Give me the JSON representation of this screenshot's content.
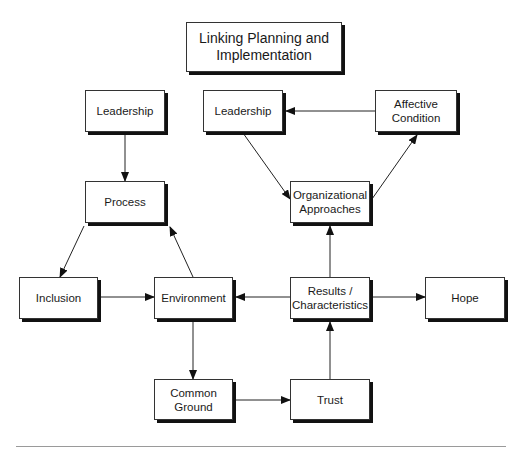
{
  "diagram": {
    "title": "Linking Planning and\nImplementation",
    "nodes": [
      {
        "id": "leadership-left",
        "label": "Leadership",
        "x": 85,
        "y": 90,
        "w": 80,
        "h": 42
      },
      {
        "id": "process",
        "label": "Process",
        "x": 85,
        "y": 181,
        "w": 80,
        "h": 42
      },
      {
        "id": "leadership-right",
        "label": "Leadership",
        "x": 203,
        "y": 90,
        "w": 80,
        "h": 42
      },
      {
        "id": "affective-condition",
        "label": "Affective\nCondition",
        "x": 375,
        "y": 90,
        "w": 82,
        "h": 42
      },
      {
        "id": "organizational-approaches",
        "label": "Organizational\nApproaches",
        "x": 290,
        "y": 181,
        "w": 80,
        "h": 42
      },
      {
        "id": "inclusion",
        "label": "Inclusion",
        "x": 19,
        "y": 277,
        "w": 79,
        "h": 42
      },
      {
        "id": "environment",
        "label": "Environment",
        "x": 154,
        "y": 277,
        "w": 79,
        "h": 42
      },
      {
        "id": "results-characteristics",
        "label": "Results /\nCharacteristics",
        "x": 290,
        "y": 277,
        "w": 80,
        "h": 42
      },
      {
        "id": "hope",
        "label": "Hope",
        "x": 425,
        "y": 277,
        "w": 80,
        "h": 42
      },
      {
        "id": "common-ground",
        "label": "Common\nGround",
        "x": 154,
        "y": 379,
        "w": 79,
        "h": 41
      },
      {
        "id": "trust",
        "label": "Trust",
        "x": 290,
        "y": 379,
        "w": 80,
        "h": 41
      }
    ],
    "edges": [
      {
        "from": "Leadership (left)",
        "to": "Process"
      },
      {
        "from": "Process",
        "to": "Inclusion"
      },
      {
        "from": "Inclusion",
        "to": "Environment"
      },
      {
        "from": "Environment",
        "to": "Process"
      },
      {
        "from": "Environment",
        "to": "Common Ground"
      },
      {
        "from": "Common Ground",
        "to": "Trust"
      },
      {
        "from": "Trust",
        "to": "Results / Characteristics"
      },
      {
        "from": "Results / Characteristics",
        "to": "Environment"
      },
      {
        "from": "Results / Characteristics",
        "to": "Hope"
      },
      {
        "from": "Results / Characteristics",
        "to": "Organizational Approaches"
      },
      {
        "from": "Organizational Approaches",
        "to": "Affective Condition"
      },
      {
        "from": "Affective Condition",
        "to": "Leadership (right)"
      },
      {
        "from": "Leadership (right)",
        "to": "Organizational Approaches"
      }
    ]
  }
}
